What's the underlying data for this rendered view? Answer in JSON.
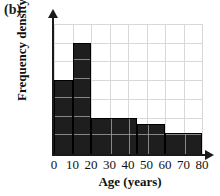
{
  "panel": {
    "label": "(b)"
  },
  "chart_data": {
    "type": "bar",
    "title": "",
    "xlabel": "Age (years)",
    "ylabel": "Frequency density",
    "grid": true,
    "legend": "none",
    "xlim": [
      0,
      80
    ],
    "ylim": [
      0,
      7
    ],
    "xticks": [
      0,
      10,
      20,
      30,
      40,
      50,
      60,
      70,
      80
    ],
    "xtick_labels": [
      "0",
      "10",
      "20",
      "30",
      "40",
      "50",
      "60",
      "70",
      "80"
    ],
    "yticks": [],
    "ytick_labels": [],
    "bar_color": "#1e1e1e",
    "grid_color": "#d8d8d8",
    "bins": [
      {
        "label": "0-10",
        "x0": 0,
        "x1": 10,
        "value": 4.0
      },
      {
        "label": "10-20",
        "x0": 10,
        "x1": 20,
        "value": 6.0
      },
      {
        "label": "20-45",
        "x0": 20,
        "x1": 45,
        "value": 2.0
      },
      {
        "label": "45-60",
        "x0": 45,
        "x1": 60,
        "value": 1.65
      },
      {
        "label": "60-80",
        "x0": 60,
        "x1": 80,
        "value": 1.18
      }
    ]
  }
}
